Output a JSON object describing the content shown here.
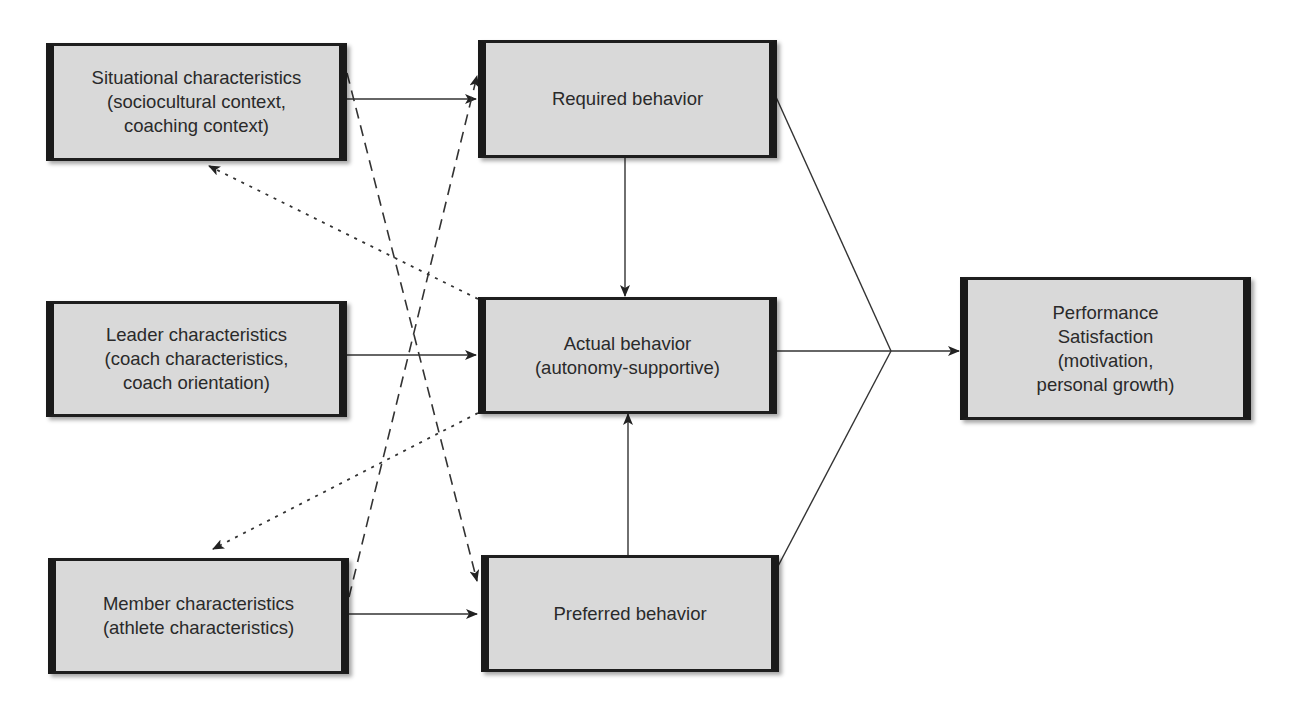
{
  "diagram": {
    "type": "flow-model",
    "colors": {
      "box_fill": "#d9d9d9",
      "box_border": "#1a1a1a",
      "line": "#333333",
      "text": "#2a2a2a",
      "background": "#ffffff"
    },
    "nodes": {
      "situational": {
        "label": "Situational characteristics\n(sociocultural context,\ncoaching context)"
      },
      "leader": {
        "label": "Leader characteristics\n(coach characteristics,\ncoach orientation)"
      },
      "member": {
        "label": "Member characteristics\n(athlete characteristics)"
      },
      "required": {
        "label": "Required behavior"
      },
      "actual": {
        "label": "Actual behavior\n(autonomy-supportive)"
      },
      "preferred": {
        "label": "Preferred behavior"
      },
      "outcome": {
        "label": "Performance\nSatisfaction\n(motivation,\npersonal growth)"
      }
    },
    "edges": [
      {
        "from": "situational",
        "to": "required",
        "style": "solid"
      },
      {
        "from": "leader",
        "to": "actual",
        "style": "solid"
      },
      {
        "from": "member",
        "to": "preferred",
        "style": "solid"
      },
      {
        "from": "situational",
        "to": "preferred",
        "style": "dashed"
      },
      {
        "from": "member",
        "to": "required",
        "style": "dashed"
      },
      {
        "from": "required",
        "to": "actual",
        "style": "solid"
      },
      {
        "from": "preferred",
        "to": "actual",
        "style": "solid"
      },
      {
        "from": "actual",
        "to": "situational",
        "style": "dotted"
      },
      {
        "from": "actual",
        "to": "member",
        "style": "dotted"
      },
      {
        "from": "required",
        "to": "outcome",
        "style": "solid",
        "converge": true
      },
      {
        "from": "actual",
        "to": "outcome",
        "style": "solid",
        "converge": true
      },
      {
        "from": "preferred",
        "to": "outcome",
        "style": "solid",
        "converge": true
      }
    ]
  }
}
